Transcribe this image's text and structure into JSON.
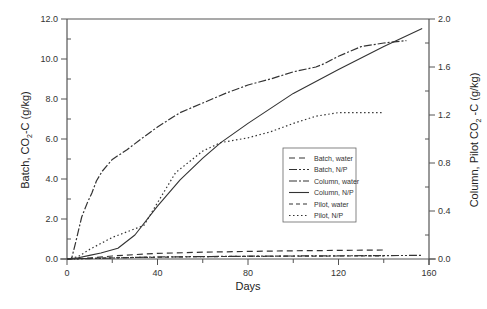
{
  "chart_data": {
    "type": "line",
    "title": "",
    "xlabel": "Days",
    "ylabel_left": "Batch, CO2-C (g/kg)",
    "ylabel_right": "Column, Pilot CO2-C (g/kg)",
    "xlim": [
      0,
      160
    ],
    "ylim_left": [
      0,
      12
    ],
    "ylim_right": [
      0,
      2
    ],
    "x_ticks": [
      "0",
      "40",
      "80",
      "120",
      "160"
    ],
    "y_ticks_left": [
      "0.0",
      "2.0",
      "4.0",
      "6.0",
      "8.0",
      "10.0",
      "12.0"
    ],
    "y_ticks_right": [
      "0.0",
      "0.4",
      "0.8",
      "1.2",
      "1.6",
      "2.0"
    ],
    "grid": false,
    "legend_position": "center-right",
    "series": [
      {
        "name": "Batch, water",
        "axis": "left",
        "dash": "6,4",
        "x": [
          0,
          10,
          20,
          30,
          40,
          60,
          80,
          100,
          120,
          140
        ],
        "y": [
          0,
          0.05,
          0.15,
          0.22,
          0.28,
          0.34,
          0.38,
          0.41,
          0.43,
          0.45
        ]
      },
      {
        "name": "Batch, N/P",
        "axis": "left",
        "dash": "8,2,2,2,2,2",
        "x": [
          0,
          10,
          20,
          30,
          40,
          60,
          80,
          100,
          120,
          140,
          157
        ],
        "y": [
          0,
          0.02,
          0.05,
          0.08,
          0.1,
          0.12,
          0.14,
          0.15,
          0.16,
          0.17,
          0.18
        ]
      },
      {
        "name": "Column, water",
        "axis": "right",
        "dash": "8,2,2,2",
        "x": [
          0,
          2,
          4,
          6.5,
          9,
          11,
          13,
          15.5,
          20,
          26.5,
          32,
          40,
          50,
          60,
          70,
          80,
          90,
          100,
          110,
          114,
          120,
          130,
          140,
          150
        ],
        "y": [
          0,
          0,
          0.15,
          0.35,
          0.47,
          0.55,
          0.65,
          0.73,
          0.83,
          0.91,
          0.99,
          1.1,
          1.22,
          1.3,
          1.38,
          1.45,
          1.5,
          1.56,
          1.6,
          1.63,
          1.69,
          1.77,
          1.8,
          1.82
        ]
      },
      {
        "name": "Column, N/P",
        "axis": "right",
        "dash": "",
        "x": [
          0,
          5,
          10,
          15,
          22.5,
          30,
          40,
          50,
          60,
          68,
          80,
          100,
          120,
          140,
          157
        ],
        "y": [
          0,
          0.01,
          0.03,
          0.05,
          0.09,
          0.2,
          0.44,
          0.66,
          0.84,
          0.97,
          1.13,
          1.38,
          1.58,
          1.77,
          1.92
        ]
      },
      {
        "name": "Pilot, water",
        "axis": "right",
        "dash": "4,3",
        "x": [
          0,
          10,
          20,
          40,
          60,
          80,
          100,
          120,
          140
        ],
        "y": [
          0,
          0.005,
          0.01,
          0.015,
          0.02,
          0.022,
          0.024,
          0.025,
          0.026
        ]
      },
      {
        "name": "Pilot, N/P",
        "axis": "right",
        "dash": "1.5,2.5",
        "x": [
          0,
          5,
          10,
          20,
          34,
          48,
          60,
          68,
          80,
          90,
          100,
          110,
          120,
          140
        ],
        "y": [
          0,
          0.02,
          0.08,
          0.18,
          0.28,
          0.72,
          0.9,
          0.97,
          1.01,
          1.06,
          1.13,
          1.19,
          1.22,
          1.22
        ]
      }
    ]
  },
  "axes": {
    "x_title": "Days",
    "y_left_title_main": "Batch, CO",
    "y_left_title_sub": "2",
    "y_left_title_end": "-C (g/kg)",
    "y_right_title_main": "Column, Pilot CO",
    "y_right_title_sub": "2",
    "y_right_title_end": " -C (g/kg)"
  },
  "legend": {
    "items": [
      "Batch, water",
      "Batch, N/P",
      "Column, water",
      "Column, N/P",
      "Pilot, water",
      "Pilot, N/P"
    ]
  },
  "colors": {
    "line": "#333333",
    "axis": "#444444",
    "background": "#ffffff"
  }
}
